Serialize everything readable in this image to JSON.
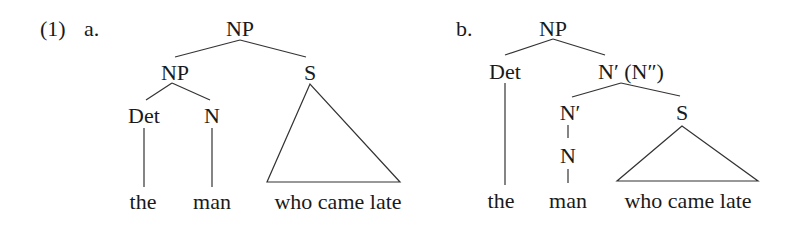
{
  "example": {
    "number": "(1)",
    "a": {
      "label": "a.",
      "nodes": {
        "root": "NP",
        "np": "NP",
        "s": "S",
        "det": "Det",
        "n": "N"
      },
      "leaves": {
        "the": "the",
        "man": "man",
        "clause": "who came late"
      }
    },
    "b": {
      "label": "b.",
      "nodes": {
        "root": "NP",
        "det": "Det",
        "nbar": "N′ (N″)",
        "nbar2": "N′",
        "s": "S",
        "n": "N"
      },
      "leaves": {
        "the": "the",
        "man": "man",
        "clause": "who came late"
      }
    }
  }
}
